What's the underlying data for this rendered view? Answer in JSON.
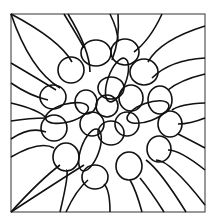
{
  "artwork": {
    "description": "Black line-art pattern of overlapping circles and radiating curves inside a square frame",
    "stroke_color": "#111111",
    "frame_color": "#333333",
    "background": "#ffffff",
    "frame": {
      "x": 11,
      "y": 14,
      "w": 194,
      "h": 198
    },
    "ellipses": [
      {
        "cx": 107,
        "cy": 106,
        "rx": 11,
        "ry": 11
      },
      {
        "cx": 111,
        "cy": 88,
        "rx": 13,
        "ry": 11
      },
      {
        "cx": 131,
        "cy": 98,
        "rx": 12,
        "ry": 13
      },
      {
        "cx": 127,
        "cy": 124,
        "rx": 12,
        "ry": 12
      },
      {
        "cx": 111,
        "cy": 133,
        "rx": 13,
        "ry": 12
      },
      {
        "cx": 92,
        "cy": 124,
        "rx": 12,
        "ry": 12
      },
      {
        "cx": 86,
        "cy": 102,
        "rx": 11,
        "ry": 12
      },
      {
        "cx": 96,
        "cy": 53,
        "rx": 15,
        "ry": 13
      },
      {
        "cx": 125,
        "cy": 52,
        "rx": 14,
        "ry": 13
      },
      {
        "cx": 71,
        "cy": 70,
        "rx": 13,
        "ry": 13
      },
      {
        "cx": 144,
        "cy": 72,
        "rx": 14,
        "ry": 13
      },
      {
        "cx": 53,
        "cy": 97,
        "rx": 13,
        "ry": 12
      },
      {
        "cx": 160,
        "cy": 100,
        "rx": 12,
        "ry": 14
      },
      {
        "cx": 54,
        "cy": 128,
        "rx": 13,
        "ry": 13
      },
      {
        "cx": 170,
        "cy": 124,
        "rx": 12,
        "ry": 13
      },
      {
        "cx": 66,
        "cy": 157,
        "rx": 13,
        "ry": 14
      },
      {
        "cx": 159,
        "cy": 149,
        "rx": 12,
        "ry": 13
      },
      {
        "cx": 95,
        "cy": 177,
        "rx": 13,
        "ry": 12
      },
      {
        "cx": 129,
        "cy": 166,
        "rx": 13,
        "ry": 14
      },
      {
        "cx": 117,
        "cy": 80,
        "rx": 9,
        "ry": 23,
        "rot": 20
      },
      {
        "cx": 90,
        "cy": 150,
        "rx": 9,
        "ry": 22,
        "rot": 20
      },
      {
        "cx": 148,
        "cy": 112,
        "rx": 22,
        "ry": 9,
        "rot": -20
      },
      {
        "cx": 67,
        "cy": 113,
        "rx": 22,
        "ry": 9,
        "rot": -15
      }
    ],
    "curves": [
      "M11 14 Q60 40 72 62",
      "M11 14 Q30 70 60 88",
      "M11 63 Q40 80 56 90",
      "M11 83 Q30 96 48 100",
      "M11 103 Q40 110 46 118",
      "M11 121 Q30 118 46 118",
      "M11 139 Q30 126 46 132",
      "M11 157 Q40 140 54 148",
      "M11 212 Q40 180 60 165",
      "M11 212 Q60 180 84 165",
      "M64 14 Q80 40 84 48",
      "M68 14 Q90 50 90 72",
      "M110 14 Q118 30 118 42",
      "M118 14 Q120 40 112 60",
      "M162 14 Q150 40 134 52",
      "M205 26 Q160 40 148 62",
      "M205 58 Q170 60 152 78",
      "M205 74 Q180 80 168 90",
      "M205 103 Q180 104 172 110",
      "M205 118 Q190 124 178 124",
      "M205 148 Q190 140 178 134",
      "M205 170 Q180 150 168 150",
      "M205 205 Q170 160 156 160",
      "M186 212 Q160 170 146 160",
      "M164 212 Q150 190 140 178",
      "M142 212 Q136 190 130 180",
      "M110 212 Q110 190 104 184",
      "M66 212 Q76 190 88 180",
      "M60 212 Q70 170 66 170"
    ]
  }
}
